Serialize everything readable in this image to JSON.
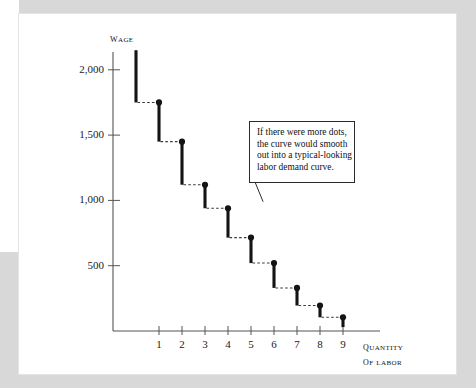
{
  "figure": {
    "background_color": "#ffffff",
    "page_background_color": "#d8d8d8",
    "ink_color": "#141414"
  },
  "axes": {
    "y_title": "Wage",
    "x_title_line1": "Quantity",
    "x_title_line2": "of Labor"
  },
  "callout": {
    "lines": [
      "If there were more dots,",
      "the curve would smooth",
      "out into a typical-looking",
      "labor demand curve."
    ]
  },
  "chart_data": {
    "type": "bar",
    "title": "",
    "subtitle": "",
    "xlabel": "Quantity of Labor",
    "ylabel": "Wage",
    "categories": [
      "0",
      "1",
      "2",
      "3",
      "4",
      "5",
      "6",
      "7",
      "8",
      "9"
    ],
    "x": [
      0,
      1,
      2,
      3,
      4,
      5,
      6,
      7,
      8,
      9
    ],
    "values": [
      1750,
      1750,
      1450,
      1120,
      940,
      715,
      520,
      330,
      195,
      105
    ],
    "bar_tops": [
      2150,
      1750,
      1450,
      1120,
      940,
      715,
      520,
      330,
      195,
      105
    ],
    "bar_bottoms": [
      1750,
      1450,
      1120,
      940,
      715,
      520,
      330,
      195,
      105,
      30
    ],
    "series": [
      {
        "name": "Marginal value of labor (step demand)",
        "values": [
          1750,
          1750,
          1450,
          1120,
          940,
          715,
          520,
          330,
          195,
          105
        ]
      }
    ],
    "dot_markers": [
      {
        "x": 1,
        "y": 1750
      },
      {
        "x": 2,
        "y": 1450
      },
      {
        "x": 3,
        "y": 1120
      },
      {
        "x": 4,
        "y": 940
      },
      {
        "x": 5,
        "y": 715
      },
      {
        "x": 6,
        "y": 520
      },
      {
        "x": 7,
        "y": 330
      },
      {
        "x": 8,
        "y": 195
      },
      {
        "x": 9,
        "y": 105
      }
    ],
    "ytick_labels": [
      "500",
      "1,000",
      "1,500",
      "2,000"
    ],
    "ytick_values": [
      500,
      1000,
      1500,
      2000
    ],
    "xtick_labels": [
      "1",
      "2",
      "3",
      "4",
      "5",
      "6",
      "7",
      "8",
      "9"
    ],
    "xtick_values": [
      1,
      2,
      3,
      4,
      5,
      6,
      7,
      8,
      9
    ],
    "ylim": [
      0,
      2250
    ],
    "xlim": [
      -0.35,
      10.6
    ],
    "grid": false,
    "legend": "none",
    "annotations": [
      {
        "text": "If there were more dots, the curve would smooth out into a typical-looking labor demand curve.",
        "points_to_x": 5.7,
        "points_to_y": 990
      }
    ]
  }
}
